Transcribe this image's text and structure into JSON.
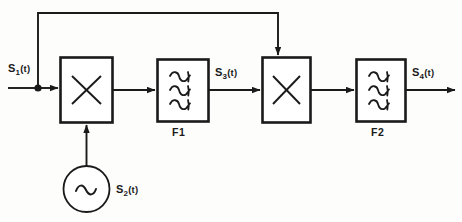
{
  "diagram": {
    "background_color": "#fdfdfc",
    "line_color": "#1a1a1a",
    "signals": {
      "input_label": "S",
      "s1": {
        "base": "S",
        "sub": "1",
        "arg": "(t)"
      },
      "s2": {
        "base": "S",
        "sub": "2",
        "arg": "(t)"
      },
      "s3": {
        "base": "S",
        "sub": "3",
        "arg": "(t)"
      },
      "s4": {
        "base": "S",
        "sub": "4",
        "arg": "(t)"
      }
    },
    "blocks": [
      {
        "id": "mixer1",
        "type": "multiplier",
        "symbol": "x-cross",
        "label": ""
      },
      {
        "id": "filter1",
        "type": "filter",
        "symbol": "triple-wave",
        "label": "F1"
      },
      {
        "id": "mixer2",
        "type": "multiplier",
        "symbol": "x-cross",
        "label": ""
      },
      {
        "id": "filter2",
        "type": "filter",
        "symbol": "triple-wave",
        "label": "F2"
      }
    ],
    "oscillator": {
      "type": "sine-source",
      "symbol": "sine-wave",
      "label": "S2(t)"
    },
    "filter1_name": "F1",
    "filter2_name": "F2"
  }
}
